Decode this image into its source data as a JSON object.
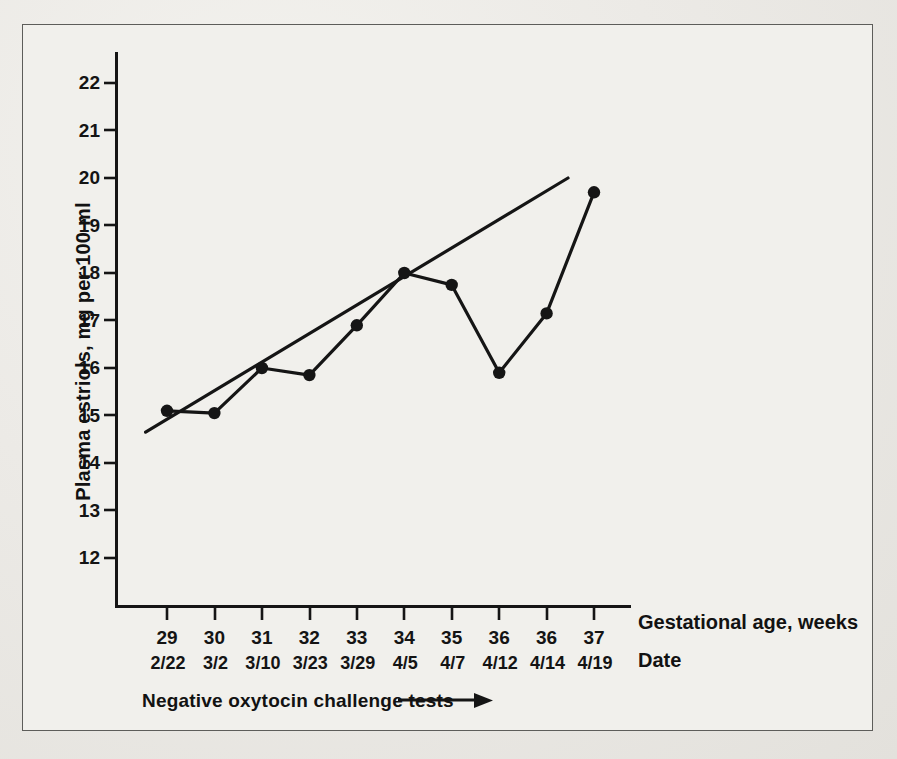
{
  "chart_data": {
    "type": "line",
    "title": "",
    "xlabel": "Gestational age, weeks",
    "ylabel": "Plasma estriols, mg per 100 ml",
    "date_axis_label": "Date",
    "annotation": "Negative  oxytocin challenge tests",
    "annotation_arrow": "→",
    "grid": false,
    "legend": "none",
    "ylim": [
      11.5,
      22.6
    ],
    "yticks": [
      22,
      21,
      20,
      19,
      18,
      17,
      16,
      15,
      14,
      13,
      12
    ],
    "ytick_labels": [
      "22",
      "21",
      "20",
      "19",
      "18",
      "17",
      "16",
      "15",
      "14",
      "13",
      "12"
    ],
    "categories": [
      "29",
      "30",
      "31",
      "32",
      "33",
      "34",
      "35",
      "36",
      "36",
      "37"
    ],
    "dates": [
      "2/22",
      "3/2",
      "3/10",
      "3/23",
      "3/29",
      "4/5",
      "4/7",
      "4/12",
      "4/14",
      "4/19"
    ],
    "series": [
      {
        "name": "Plasma estriols",
        "marker": "filled-circle",
        "values": [
          15.1,
          15.05,
          16.0,
          15.85,
          16.9,
          18.0,
          17.75,
          15.9,
          17.15,
          19.7
        ]
      },
      {
        "name": "Trend line",
        "marker": "none",
        "x_range": [
          28.55,
          37.45
        ],
        "y_range": [
          14.65,
          20.0
        ]
      }
    ],
    "colors": {
      "ink": "#151515",
      "paper": "#f1f0ec",
      "page": "#e6e5e0",
      "frame": "#5d5d5a"
    }
  }
}
